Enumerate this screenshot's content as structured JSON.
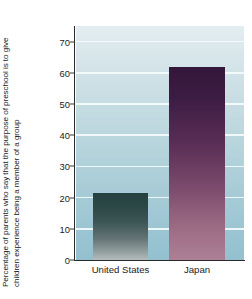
{
  "chart_data": {
    "type": "bar",
    "title": "",
    "subtitle": "",
    "xlabel": "",
    "ylabel": "Percentage of parents who say that the purpose of preschool is to give children experience being a member of a group",
    "categories": [
      "United States",
      "Japan"
    ],
    "values": [
      21.5,
      62
    ],
    "series": [
      {
        "name": "Percentage of parents",
        "values": [
          21.5,
          62
        ]
      }
    ],
    "ylim": [
      0,
      75
    ],
    "yticks": [
      0,
      10,
      20,
      30,
      40,
      50,
      60,
      70
    ],
    "ytick_labels": [
      "0",
      "10",
      "20",
      "30",
      "40",
      "50",
      "60",
      "70"
    ],
    "grid": true,
    "grid_axis": "y",
    "legend": false,
    "legend_position": "none",
    "colors": {
      "bar_united_states_top": "#24403f",
      "bar_united_states_bottom": "#b4bcbc",
      "bar_japan_top": "#33173a",
      "bar_japan_bottom": "#ad8095",
      "plot_background_top": "#e3eef1",
      "plot_background_bottom": "#93c0cf",
      "gridline": "#f4fbfb",
      "axis": "#2a2a2a",
      "text": "#1c1c1c",
      "figure_background": "#ffffff"
    }
  },
  "axis": {
    "ylabel_text": "Percentage of parents who say that the purpose of preschool is to give children experience being a member of a group",
    "ticks": [
      {
        "label": "70",
        "value": 70
      },
      {
        "label": "60",
        "value": 60
      },
      {
        "label": "50",
        "value": 50
      },
      {
        "label": "40",
        "value": 40
      },
      {
        "label": "30",
        "value": 30
      },
      {
        "label": "20",
        "value": 20
      },
      {
        "label": "10",
        "value": 10
      },
      {
        "label": "0",
        "value": 0
      }
    ]
  },
  "bars": [
    {
      "category": "United States",
      "value": 21.5,
      "label": "United States"
    },
    {
      "category": "Japan",
      "value": 62,
      "label": "Japan"
    }
  ]
}
